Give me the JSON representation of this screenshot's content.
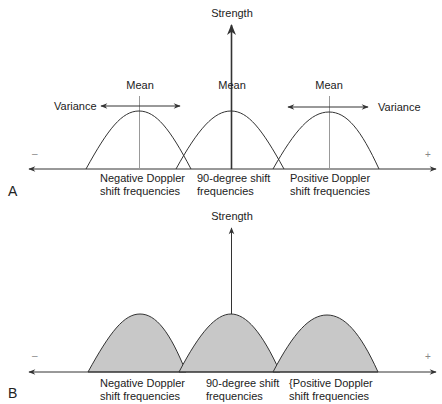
{
  "figure": {
    "panels": [
      {
        "letter": "A",
        "y_axis_label": "Strength",
        "axis_negative_sign": "–",
        "axis_positive_sign": "+",
        "mean_labels": [
          "Mean",
          "Mean",
          "Mean"
        ],
        "variance_labels": [
          "Variance",
          "Variance"
        ],
        "curve_labels": [
          {
            "line1": "Negative Doppler",
            "line2": "shift frequencies"
          },
          {
            "line1": "90-degree shift",
            "line2": "frequencies"
          },
          {
            "line1": "Positive Doppler",
            "line2": "shift frequencies"
          }
        ],
        "fill": "none"
      },
      {
        "letter": "B",
        "y_axis_label": "Strength",
        "axis_negative_sign": "–",
        "axis_positive_sign": "+",
        "curve_labels": [
          {
            "line1": "Negative Doppler",
            "line2": "shift frequencies"
          },
          {
            "line1": "90-degree shift",
            "line2": "frequencies"
          },
          {
            "line1": "{Positive Doppler",
            "line2": "shift frequencies"
          }
        ],
        "fill": "#c8c8c8"
      }
    ],
    "colors": {
      "line": "#333333",
      "mean_line": "#999999",
      "curve_fill": "#c8c8c8",
      "background": "#ffffff"
    }
  }
}
